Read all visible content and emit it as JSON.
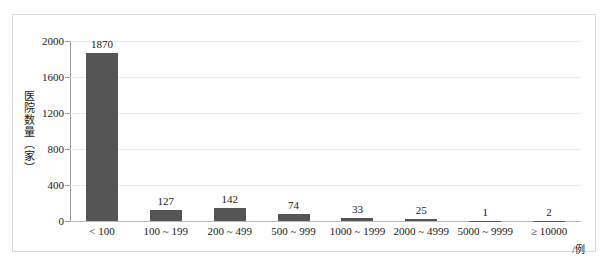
{
  "chart_data": {
    "type": "bar",
    "title": "",
    "xlabel": "/例",
    "ylabel": "医院数量（家）",
    "categories": [
      "< 100",
      "100 ~ 199",
      "200 ~ 499",
      "500 ~ 999",
      "1000 ~ 1999",
      "2000 ~ 4999",
      "5000 ~ 9999",
      "≥ 10000"
    ],
    "values": [
      1870,
      127,
      142,
      74,
      33,
      25,
      1,
      2
    ],
    "value_labels": [
      "1870",
      "127",
      "142",
      "74",
      "33",
      "25",
      "1",
      "2"
    ],
    "ylim": [
      0,
      2000
    ],
    "ytick_labels": [
      "0",
      "400",
      "800",
      "1200",
      "1600",
      "2000"
    ],
    "ytick_values": [
      0,
      400,
      800,
      1200,
      1600,
      2000
    ],
    "grid": true,
    "legend": false,
    "bar_color": "#555555",
    "gridline_color": "#e9e9e9",
    "axis_color": "#9a9a9a"
  }
}
